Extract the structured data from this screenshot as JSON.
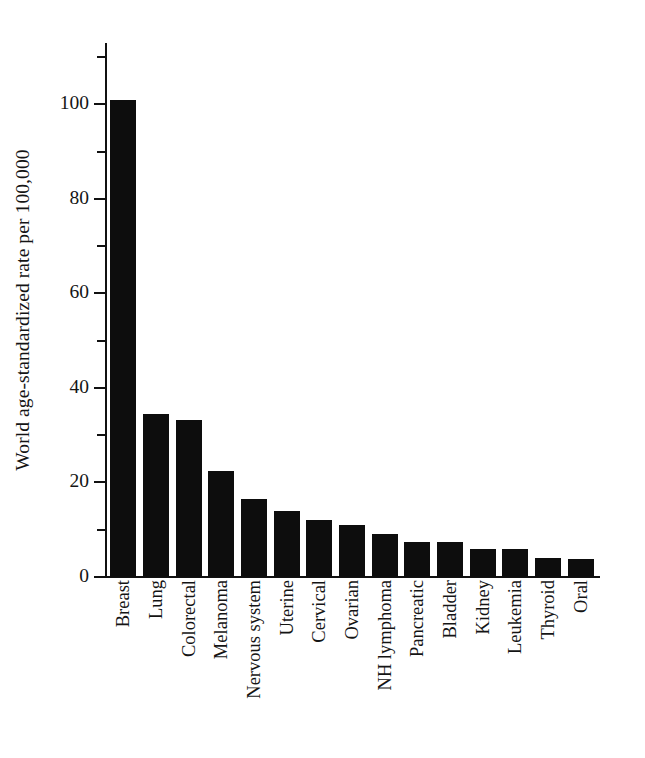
{
  "chart_data": {
    "type": "bar",
    "title": "",
    "xlabel": "",
    "ylabel": "World age-standardized rate per 100,000",
    "ylim": [
      0,
      113
    ],
    "grid": false,
    "legend": "none",
    "y_major_ticks": [
      0,
      20,
      40,
      60,
      80,
      100
    ],
    "y_major_tick_labels": [
      "0",
      "20",
      "40",
      "60",
      "80",
      "100"
    ],
    "y_minor_ticks": [
      10,
      30,
      50,
      70,
      90,
      110
    ],
    "categories": [
      "Breast",
      "Lung",
      "Colorectal",
      "Melanoma",
      "Nervous system",
      "Uterine",
      "Cervical",
      "Ovarian",
      "NH lymphoma",
      "Pancreatic",
      "Bladder",
      "Kidney",
      "Leukemia",
      "Thyroid",
      "Oral"
    ],
    "values": [
      101,
      34.5,
      33.3,
      22.4,
      16.6,
      14,
      12.1,
      11.1,
      9,
      7.5,
      7.4,
      6,
      5.9,
      4,
      3.9
    ],
    "bar_color": "#0d0d0d",
    "background_color": "#ffffff"
  }
}
